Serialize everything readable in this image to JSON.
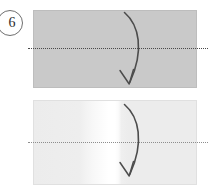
{
  "figure": {
    "step_number": "6",
    "type": "origami-fold-diagram",
    "panel_count": 2
  },
  "step_badge": {
    "label": "6",
    "shape": "circle",
    "border_color": "#6f6f6f",
    "text_color": "#2b2b2b"
  },
  "panels": [
    {
      "name": "upper-panel",
      "state": "before-fold",
      "fill": "#c9c9c9",
      "border_color": "#bdbdbd",
      "fold_line": {
        "orientation": "horizontal",
        "style": "dotted",
        "color": "#4a4a4a"
      },
      "arrow": {
        "name": "fold-arrow",
        "direction": "downward-curving-left",
        "style": "curved-arc",
        "color": "#4c4c4c"
      }
    },
    {
      "name": "lower-panel",
      "state": "after-fold",
      "fill": "#ececec",
      "highlight_fill": "#ffffff",
      "border_color": "#e0e0e0",
      "fold_line": {
        "orientation": "horizontal",
        "style": "dotted",
        "color": "#8d8d8d"
      },
      "arrow": {
        "name": "fold-arrow",
        "direction": "downward-curving-left",
        "style": "curved-arc",
        "color": "#4c4c4c"
      }
    }
  ],
  "colors": {
    "background": "#ffffff",
    "panel_gray": "#c9c9c9",
    "panel_light": "#ececec",
    "ink": "#4c4c4c"
  }
}
